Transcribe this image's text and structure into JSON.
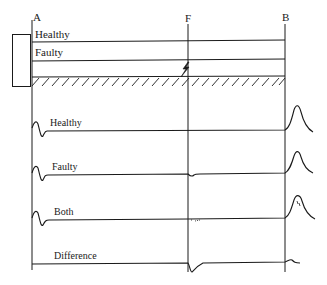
{
  "diagram": {
    "type": "transmission-line-fault-traveling-wave",
    "points": {
      "A": "A",
      "F": "F",
      "B": "B"
    },
    "line_labels": {
      "healthy": "Healthy",
      "faulty": "Faulty"
    },
    "traces": [
      {
        "id": "healthy",
        "label": "Healthy"
      },
      {
        "id": "faulty",
        "label": "Faulty"
      },
      {
        "id": "both",
        "label": "Both"
      },
      {
        "id": "difference",
        "label": "Difference"
      }
    ],
    "colors": {
      "stroke": "#1a1a1a",
      "background": "#ffffff"
    }
  }
}
